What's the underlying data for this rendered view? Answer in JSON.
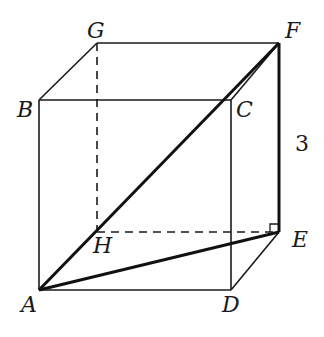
{
  "figure": {
    "type": "cube-diagram",
    "vertices": {
      "A": {
        "label": "A",
        "x": 39,
        "y": 290
      },
      "B": {
        "label": "B",
        "x": 39,
        "y": 100
      },
      "C": {
        "label": "C",
        "x": 231,
        "y": 100
      },
      "D": {
        "label": "D",
        "x": 231,
        "y": 290
      },
      "E": {
        "label": "E",
        "x": 279,
        "y": 232
      },
      "F": {
        "label": "F",
        "x": 279,
        "y": 43
      },
      "G": {
        "label": "G",
        "x": 97,
        "y": 43
      },
      "H": {
        "label": "H",
        "x": 97,
        "y": 232
      }
    },
    "edge_length_label": "3",
    "edges_solid": [
      "AB",
      "BC",
      "CD",
      "DA",
      "BG",
      "GF",
      "CF",
      "DE"
    ],
    "edges_hidden": [
      "GH",
      "HE"
    ],
    "segments_bold": [
      "AF",
      "AE",
      "FE"
    ],
    "right_angle_at": "E"
  }
}
